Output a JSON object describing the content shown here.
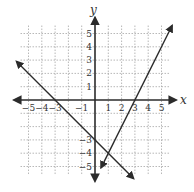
{
  "chart_data": {
    "type": "line",
    "title": "",
    "xlabel": "x",
    "ylabel": "y",
    "xlim": [
      -5,
      5
    ],
    "ylim": [
      -5,
      5
    ],
    "grid": true,
    "grid_style": "dashed",
    "x_ticks": [
      "−5",
      "−4",
      "−3",
      "−1",
      "1",
      "2",
      "3",
      "4",
      "5"
    ],
    "x_tick_values": [
      -5,
      -4,
      -3,
      -1,
      1,
      2,
      3,
      4,
      5
    ],
    "y_ticks": [
      "5",
      "4",
      "3",
      "2",
      "1",
      "−3",
      "−4",
      "−5"
    ],
    "y_tick_values": [
      5,
      4,
      3,
      2,
      1,
      -3,
      -4,
      -5
    ],
    "series": [
      {
        "name": "line 1 (y = -x - 3)",
        "equation": "y = -x - 3",
        "slope": -1,
        "intercept": -3,
        "x": [
          -5.9,
          -3,
          0,
          1,
          2.9
        ],
        "y": [
          2.9,
          0,
          -3,
          -4,
          -5.9
        ]
      },
      {
        "name": "line 2 (y = 2x - 6)",
        "equation": "y = 2x - 6",
        "slope": 2,
        "intercept": -6,
        "x": [
          0.45,
          1,
          3,
          5.8
        ],
        "y": [
          -5.1,
          -4,
          0,
          5.6
        ]
      }
    ],
    "intersection": {
      "x": 1,
      "y": -4
    },
    "legend": null
  },
  "axes": {
    "x_label": "x",
    "y_label": "y"
  },
  "colors": {
    "line": "#2b2b2b",
    "grid": "#9a9a9a",
    "text": "#333333"
  }
}
